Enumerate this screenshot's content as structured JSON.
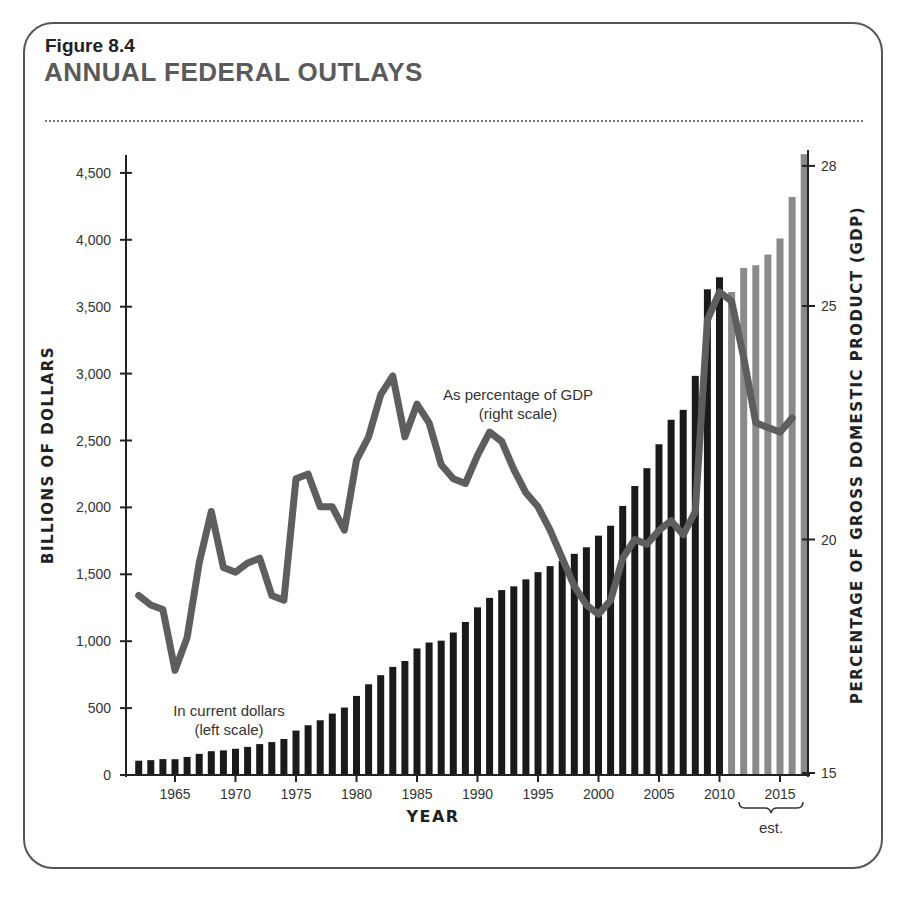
{
  "figure": {
    "number": "Figure 8.4",
    "title": "ANNUAL FEDERAL OUTLAYS"
  },
  "chart_data": {
    "type": "bar",
    "title": "ANNUAL FEDERAL OUTLAYS",
    "subtitle": "Figure 8.4",
    "xlabel": "YEAR",
    "ylabel": "BILLIONS OF DOLLARS",
    "ylabel_right": "PERCENTAGE OF GROSS DOMESTIC PRODUCT (GDP)",
    "ylim": [
      0,
      4650
    ],
    "ylim_right": [
      15,
      28.2
    ],
    "y_ticks": [
      0,
      500,
      1000,
      1500,
      2000,
      2500,
      3000,
      3500,
      4000,
      4500
    ],
    "y_tick_labels": [
      "0",
      "500",
      "1,000",
      "1,500",
      "2,000",
      "2,500",
      "3,000",
      "3,500",
      "4,000",
      "4,500"
    ],
    "y_right_ticks": [
      15,
      20,
      25,
      28
    ],
    "x_ticks": [
      1965,
      1970,
      1975,
      1980,
      1985,
      1990,
      1995,
      2000,
      2005,
      2010,
      2015
    ],
    "grid": false,
    "annotations": [
      {
        "text": "In current dollars",
        "subtext": "(left scale)"
      },
      {
        "text": "As percentage of GDP",
        "subtext": "(right scale)"
      },
      {
        "text": "est.",
        "note": "bracket under 2012–2017 estimated values"
      }
    ],
    "estimate_start_year": 2011,
    "x": [
      1962,
      1963,
      1964,
      1965,
      1966,
      1967,
      1968,
      1969,
      1970,
      1971,
      1972,
      1973,
      1974,
      1975,
      1976,
      1977,
      1978,
      1979,
      1980,
      1981,
      1982,
      1983,
      1984,
      1985,
      1986,
      1987,
      1988,
      1989,
      1990,
      1991,
      1992,
      1993,
      1994,
      1995,
      1996,
      1997,
      1998,
      1999,
      2000,
      2001,
      2002,
      2003,
      2004,
      2005,
      2006,
      2007,
      2008,
      2009,
      2010,
      2011,
      2012,
      2013,
      2014,
      2015,
      2016,
      2017
    ],
    "series": [
      {
        "name": "In current dollars (left scale)",
        "type": "bar",
        "axis": "left",
        "color": "#1a1a1a",
        "estimate_color": "#8a8a8a",
        "values": [
          107,
          111,
          119,
          118,
          135,
          158,
          178,
          184,
          196,
          210,
          231,
          246,
          269,
          332,
          372,
          409,
          459,
          504,
          591,
          678,
          746,
          808,
          852,
          946,
          990,
          1004,
          1065,
          1144,
          1253,
          1324,
          1382,
          1410,
          1462,
          1516,
          1561,
          1601,
          1653,
          1702,
          1789,
          1863,
          2011,
          2160,
          2293,
          2472,
          2655,
          2729,
          2983,
          3630,
          3720,
          3610,
          3790,
          3810,
          3890,
          4010,
          4320,
          4640
        ]
      },
      {
        "name": "As percentage of GDP (right scale)",
        "type": "line",
        "axis": "right",
        "color": "#5e5e5e",
        "x": [
          1962,
          1963,
          1964,
          1965,
          1966,
          1967,
          1968,
          1969,
          1970,
          1971,
          1972,
          1973,
          1974,
          1975,
          1976,
          1977,
          1978,
          1979,
          1980,
          1981,
          1982,
          1983,
          1984,
          1985,
          1986,
          1987,
          1988,
          1989,
          1990,
          1991,
          1992,
          1993,
          1994,
          1995,
          1996,
          1997,
          1998,
          1999,
          2000,
          2001,
          2002,
          2003,
          2004,
          2005,
          2006,
          2007,
          2008,
          2009,
          2010,
          2011,
          2012,
          2013,
          2014,
          2015,
          2016
        ],
        "values": [
          18.8,
          18.6,
          18.5,
          17.2,
          17.9,
          19.5,
          20.6,
          19.4,
          19.3,
          19.5,
          19.6,
          18.8,
          18.7,
          21.3,
          21.4,
          20.7,
          20.7,
          20.2,
          21.7,
          22.2,
          23.1,
          23.5,
          22.2,
          22.9,
          22.5,
          21.6,
          21.3,
          21.2,
          21.8,
          22.3,
          22.1,
          21.5,
          21.0,
          20.7,
          20.2,
          19.6,
          19.0,
          18.6,
          18.4,
          18.7,
          19.6,
          20.0,
          19.9,
          20.2,
          20.4,
          20.1,
          20.6,
          24.7,
          25.3,
          25.1,
          23.9,
          22.5,
          22.4,
          22.3,
          22.6
        ]
      }
    ]
  }
}
